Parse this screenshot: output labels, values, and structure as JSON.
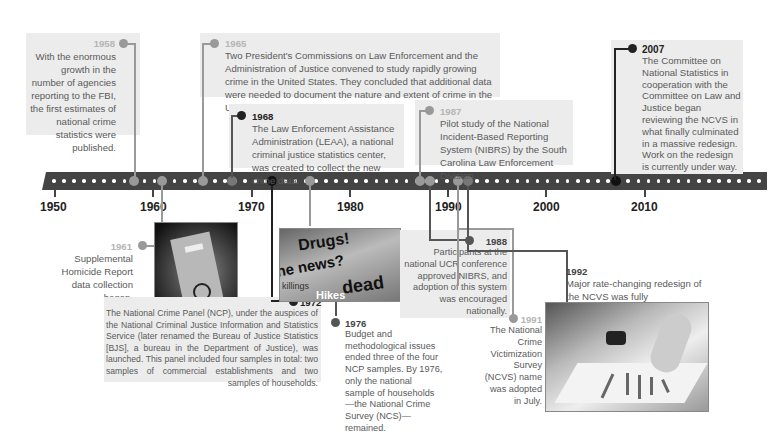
{
  "timeline": {
    "decade_labels": [
      "1950",
      "1960",
      "1970",
      "1980",
      "1990",
      "2000",
      "2010"
    ],
    "events": [
      {
        "year": "1958",
        "text": "With the enormous growth in the number of agencies reporting to the FBI, the first estimates of national crime statistics were published.",
        "emphasis": "grey"
      },
      {
        "year": "1961",
        "text": "Supplemental Homicide Report data collection began.",
        "emphasis": "grey"
      },
      {
        "year": "1965",
        "text": "Two President's Commissions on Law Enforcement and the Administration of Justice convened to study rapidly growing crime in the United States. They concluded that additional data were needed to document the nature and extent of crime in the United States.",
        "emphasis": "grey"
      },
      {
        "year": "1968",
        "text": "The Law Enforcement Assistance Administration (LEAA), a national criminal justice statistics center, was created to collect the new crime data.",
        "emphasis": "dark"
      },
      {
        "year": "1972",
        "text": "The National Crime Panel (NCP), under the auspices of the National Criminal Justice Information and Statistics Service (later renamed the Bureau of Justice Statistics [BJS], a bureau in the Department of Justice), was launched. This panel included four samples in total: two samples of commercial establishments and two samples of households.",
        "emphasis": "dark"
      },
      {
        "year": "1976",
        "text": "Budget and methodological issues ended three of the four NCP samples. By 1976, only the national sample of households—the National Crime Survey (NCS)—remained.",
        "emphasis": "dark"
      },
      {
        "year": "1987",
        "text": "Pilot study of the National Incident-Based Reporting System (NIBRS) by the South Carolina Law Enforcement Division.",
        "emphasis": "grey"
      },
      {
        "year": "1988",
        "text": "Participants at the national UCR conference approved NIBRS, and adoption of this system was encouraged nationally.",
        "emphasis": "dark"
      },
      {
        "year": "1991",
        "text": "The National Crime Victimization Survey (NCVS) name was adopted in July.",
        "emphasis": "grey"
      },
      {
        "year": "1992",
        "text": "Major rate-changing redesign of the NCVS was fully implemented.",
        "emphasis": "dark"
      },
      {
        "year": "2007",
        "text": "The Committee on National Statistics in cooperation with the Committee on Law and Justice began reviewing the NCVS in what finally culminated in a massive redesign. Work on the redesign is currently under way.",
        "emphasis": "dark"
      }
    ],
    "photos": [
      {
        "name": "case-files-handcuffs-photo",
        "caption": ""
      },
      {
        "name": "newspaper-headlines-photo",
        "words": [
          "Drugs!",
          "he news?",
          "killings",
          "dead",
          "Hikes"
        ]
      },
      {
        "name": "hands-bar-chart-photo",
        "caption": ""
      }
    ]
  },
  "colors": {
    "bar": "#444444",
    "accent_dark": "#222222",
    "accent_grey": "#999999",
    "box_bg": "#ececec"
  }
}
